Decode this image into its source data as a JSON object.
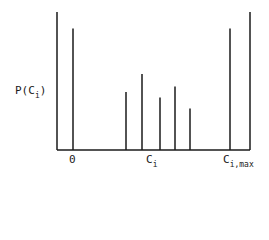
{
  "chart_data": {
    "type": "bar",
    "title": "",
    "xlabel": "C_i",
    "ylabel": "P(C_i)",
    "x_tick_labels": [
      "0",
      "C_i",
      "C_i,max"
    ],
    "categories": [
      "0",
      "c1",
      "c2",
      "c3",
      "c4",
      "c5",
      "C_i,max"
    ],
    "values": [
      0.88,
      0.42,
      0.55,
      0.38,
      0.46,
      0.3,
      0.88
    ],
    "ylim": [
      0,
      1
    ],
    "grid": false,
    "legend": null,
    "style": "stick spikes (probability mass function) with end masses at 0 and C_i,max"
  },
  "labels": {
    "y_main": "P(C",
    "y_sub": "i",
    "y_close": ")",
    "x_zero": "0",
    "x_mid_main": "C",
    "x_mid_sub": "i",
    "x_max_main": "C",
    "x_max_sub": "i,max"
  }
}
